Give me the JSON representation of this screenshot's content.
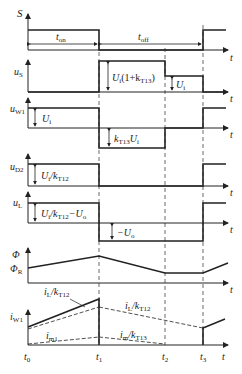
{
  "diagram": {
    "time_axis_label": "t",
    "time_markers": [
      "t0",
      "t1",
      "t2",
      "t3"
    ],
    "intervals": {
      "on": "ton",
      "off": "toff"
    },
    "waveforms": [
      {
        "name": "S",
        "label_main": "S",
        "label_sub": ""
      },
      {
        "name": "uS",
        "label_main": "u",
        "label_sub": "S",
        "annotations": [
          "Ui(1+kT13)",
          "Ui"
        ]
      },
      {
        "name": "uW1",
        "label_main": "u",
        "label_sub": "W1",
        "annotations": [
          "Ui",
          "kT13Ui"
        ]
      },
      {
        "name": "uD2",
        "label_main": "u",
        "label_sub": "D2",
        "annotations": [
          "Ui/kT12"
        ]
      },
      {
        "name": "uL",
        "label_main": "u",
        "label_sub": "L",
        "annotations": [
          "Ui/kT12-Uo",
          "-Uo"
        ]
      },
      {
        "name": "Phi",
        "label_main": "Φ",
        "label_sub": "",
        "extra_label": "ΦR"
      },
      {
        "name": "iW1",
        "label_main": "i",
        "label_sub": "W1",
        "annotations": [
          "iL/kT12",
          "iL/kT12",
          "im1",
          "im/kT13"
        ]
      }
    ]
  },
  "labels": {
    "S": "S",
    "t": "t",
    "ton_main": "t",
    "ton_sub": "on",
    "toff_main": "t",
    "toff_sub": "off",
    "uS_main": "u",
    "uS_sub": "S",
    "uS_ann1_a": "U",
    "uS_ann1_b": "i",
    "uS_ann1_c": "(1+k",
    "uS_ann1_d": "T13",
    "uS_ann1_e": ")",
    "uS_ann2_a": "U",
    "uS_ann2_b": "i",
    "uW1_main": "u",
    "uW1_sub": "W1",
    "uW1_ann1_a": "U",
    "uW1_ann1_b": "i",
    "uW1_ann2_a": "k",
    "uW1_ann2_b": "T13",
    "uW1_ann2_c": "U",
    "uW1_ann2_d": "i",
    "uD2_main": "u",
    "uD2_sub": "D2",
    "uD2_ann_a": "U",
    "uD2_ann_b": "i",
    "uD2_ann_c": "/k",
    "uD2_ann_d": "T12",
    "uL_main": "u",
    "uL_sub": "L",
    "uL_ann1_a": "U",
    "uL_ann1_b": "i",
    "uL_ann1_c": "/k",
    "uL_ann1_d": "T12",
    "uL_ann1_e": "−U",
    "uL_ann1_f": "o",
    "uL_ann2_a": "−U",
    "uL_ann2_b": "o",
    "phi": "Φ",
    "phiR_main": "Φ",
    "phiR_sub": "R",
    "iW1_main": "i",
    "iW1_sub": "W1",
    "iL1_a": "i",
    "iL1_b": "L",
    "iL1_c": "/k",
    "iL1_d": "T12",
    "iL2_a": "i",
    "iL2_b": "L",
    "iL2_c": "/k",
    "iL2_d": "T12",
    "im1_a": "i",
    "im1_b": "m1",
    "im2_a": "i",
    "im2_b": "m",
    "im2_c": "/k",
    "im2_d": "T13",
    "t0_a": "t",
    "t0_b": "0",
    "t1_a": "t",
    "t1_b": "1",
    "t2_a": "t",
    "t2_b": "2",
    "t3_a": "t",
    "t3_b": "3"
  }
}
